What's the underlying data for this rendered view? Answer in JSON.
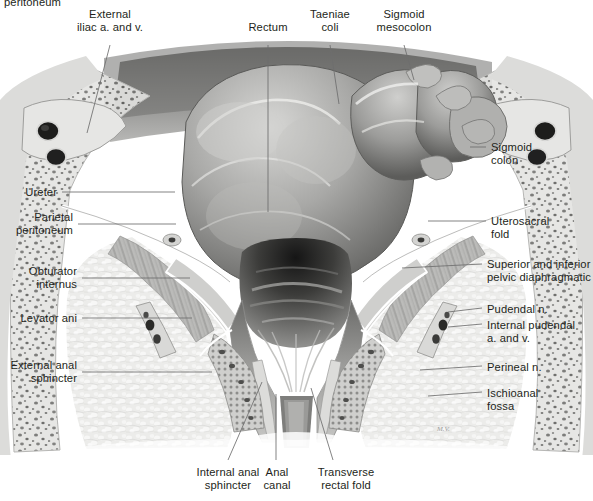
{
  "figure": {
    "kind": "anatomical-illustration",
    "title_fragment_clipped": "peritoneum",
    "style": "grayscale medical illustration",
    "artist_signature": "M.V.",
    "palette": {
      "background": "#ffffff",
      "label_text": "#231f20",
      "leader_line": "#6e6e6e",
      "tissue_light": "#e8e8e6",
      "tissue_mid": "#c2c2c0",
      "tissue_dark": "#8a8a88",
      "lumen_dark": "#1a1a1a",
      "bowel_mid": "#a9a9a7",
      "fascia_white": "#fbfbfb"
    }
  },
  "labels": {
    "top": [
      {
        "id": "external-iliac",
        "text": "External\niliac a. and v.",
        "align": "center"
      },
      {
        "id": "rectum",
        "text": "Rectum",
        "align": "center"
      },
      {
        "id": "taeniae-coli",
        "text": "Taeniae\ncoli",
        "align": "center"
      },
      {
        "id": "sigmoid-mesocolon",
        "text": "Sigmoid\nmesocolon",
        "align": "center"
      }
    ],
    "left": [
      {
        "id": "ureter",
        "text": "Ureter",
        "align": "right"
      },
      {
        "id": "parietal-peritoneum",
        "text": "Parietal\nperitoneum",
        "align": "right"
      },
      {
        "id": "obturator-internus",
        "text": "Obturator\ninternus",
        "align": "right"
      },
      {
        "id": "levator-ani",
        "text": "Levator ani",
        "align": "right"
      },
      {
        "id": "external-anal-sphincter",
        "text": "External anal\nsphincter",
        "align": "right"
      }
    ],
    "right": [
      {
        "id": "sigmoid-colon",
        "text": "Sigmoid\ncolon",
        "align": "left"
      },
      {
        "id": "uterosacral-fold",
        "text": "Uterosacral\nfold",
        "align": "left"
      },
      {
        "id": "pelvic-diaphragm-fascia",
        "text": "Superior and inferior\npelvic diaphragmatic fascia",
        "align": "left"
      },
      {
        "id": "pudendal-n",
        "text": "Pudendal n.",
        "align": "left"
      },
      {
        "id": "internal-pudendal",
        "text": "Internal pudendal\na. and v.",
        "align": "left"
      },
      {
        "id": "perineal-n",
        "text": "Perineal n.",
        "align": "left"
      },
      {
        "id": "ischioanal-fossa",
        "text": "Ischioanal\nfossa",
        "align": "left"
      }
    ],
    "bottom": [
      {
        "id": "internal-anal-sphincter",
        "text": "Internal anal\nsphincter",
        "align": "center"
      },
      {
        "id": "anal-canal",
        "text": "Anal\ncanal",
        "align": "center"
      },
      {
        "id": "transverse-rectal-fold",
        "text": "Transverse\nrectal fold",
        "align": "center"
      }
    ]
  }
}
